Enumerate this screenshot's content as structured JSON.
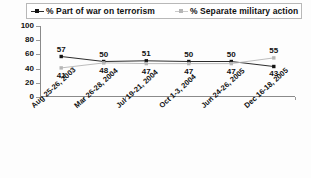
{
  "chart_data": {
    "type": "line",
    "title": "",
    "xlabel": "",
    "ylabel": "",
    "ylim": [
      0,
      100
    ],
    "yticks": [
      "0",
      "20",
      "40",
      "60",
      "80",
      "100"
    ],
    "grid": false,
    "legend_position": "top",
    "categories": [
      "Aug 25-26, 2003",
      "Mar 26-28, 2004",
      "Jul 19-21, 2004",
      "Oct 1-3, 2004",
      "Jun 24-26, 2005",
      "Dec 16-18, 2005"
    ],
    "series": [
      {
        "name": "% Part of war on terrorism",
        "marker": "filled-square",
        "color": "#141414",
        "values": [
          57,
          50,
          51,
          50,
          50,
          43
        ]
      },
      {
        "name": "% Separate military action",
        "marker": "open-square",
        "color": "#b6b6b6",
        "values": [
          41,
          48,
          47,
          47,
          47,
          55
        ]
      }
    ]
  },
  "legend": {
    "items": [
      {
        "label": "% Part of war on terrorism",
        "swatch": "dark-square-marker"
      },
      {
        "label": "% Separate military action",
        "swatch": "light-square-marker"
      }
    ]
  },
  "colors": {
    "series_dark": "#141414",
    "series_light": "#b6b6b6",
    "axis": "#8a8a8a",
    "text": "#111111",
    "background": "#fdfdfd",
    "legend_border": "#b8b8b8"
  }
}
